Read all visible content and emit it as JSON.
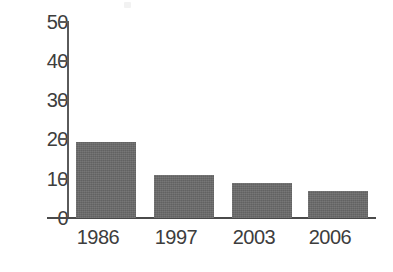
{
  "chart_data": {
    "type": "bar",
    "title": "",
    "subtitle": "",
    "xlabel": "",
    "ylabel": "",
    "categories": [
      "1986",
      "1997",
      "2003",
      "2006"
    ],
    "values": [
      19.5,
      11,
      9,
      7
    ],
    "series": [
      {
        "name": "",
        "values": [
          19.5,
          11,
          9,
          7
        ]
      }
    ],
    "ylim": [
      0,
      50
    ],
    "yticks": [
      0,
      10,
      20,
      30,
      40,
      50
    ],
    "ytick_labels": [
      "0",
      "10",
      "20",
      "30",
      "40",
      "50"
    ],
    "grid": false,
    "legend": false,
    "legend_position": "none",
    "annotations": [],
    "colors": {
      "bar_fill": "#6a6a6a",
      "axis": "#5a5a5a",
      "text": "#3d3d3d",
      "background": "#ffffff"
    }
  }
}
